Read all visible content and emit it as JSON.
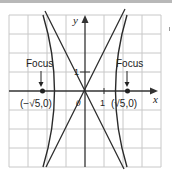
{
  "diagram": {
    "type": "hyperbola-graph",
    "equation_implied": "x^2 - y^2/4 = 1",
    "axes": {
      "x_label": "x",
      "y_label": "y",
      "origin_label": "0",
      "x_tick_label": "1",
      "y_tick_label": "1"
    },
    "grid": {
      "cols": 8,
      "rows": 8,
      "unit": 1,
      "x_range": [
        -4,
        4
      ],
      "y_range": [
        -4,
        4
      ]
    },
    "foci": [
      {
        "label": "Focus",
        "coord_label": "(−√5,0)",
        "x": -2.236,
        "y": 0
      },
      {
        "label": "Focus",
        "coord_label": "(√5,0)",
        "x": 2.236,
        "y": 0
      }
    ],
    "vertices": [
      {
        "x": -1,
        "y": 0
      },
      {
        "x": 1,
        "y": 0
      }
    ],
    "asymptotes": [
      "y = 2x",
      "y = -2x"
    ],
    "colors": {
      "grid": "#c8c8c8",
      "curve": "#2a2a2a",
      "axis": "#333333",
      "bar": "#b8b8b8"
    }
  }
}
